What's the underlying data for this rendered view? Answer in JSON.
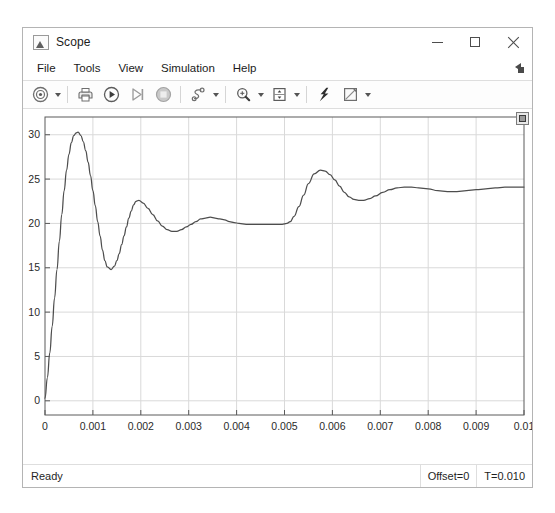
{
  "window": {
    "title": "Scope",
    "icon": "scope-app-icon",
    "controls": {
      "minimize": "minimize-icon",
      "maximize": "maximize-icon",
      "close": "close-icon"
    }
  },
  "menu": {
    "items": [
      {
        "label": "File"
      },
      {
        "label": "Tools"
      },
      {
        "label": "View"
      },
      {
        "label": "Simulation"
      },
      {
        "label": "Help"
      }
    ],
    "overflow_icon": "menu-overflow-arrow-icon"
  },
  "toolbar": {
    "buttons": [
      {
        "name": "configuration-properties-button",
        "icon": "gear-target-icon",
        "caret": true
      },
      {
        "name": "print-button",
        "icon": "printer-icon",
        "caret": false
      },
      {
        "name": "run-button",
        "icon": "play-circle-icon",
        "caret": false
      },
      {
        "name": "step-forward-button",
        "icon": "step-forward-icon",
        "caret": false
      },
      {
        "name": "stop-button",
        "icon": "stop-circle-icon",
        "caret": false
      },
      {
        "name": "simulation-stepping-button",
        "icon": "stepping-options-icon",
        "caret": true
      },
      {
        "name": "zoom-in-button",
        "icon": "magnifier-plus-icon",
        "caret": true
      },
      {
        "name": "autoscale-button",
        "icon": "autoscale-icon",
        "caret": true
      },
      {
        "name": "cursor-measurements-button",
        "icon": "lightning-cursor-icon",
        "caret": false
      },
      {
        "name": "style-button",
        "icon": "pencil-style-icon",
        "caret": true
      }
    ],
    "float_icon": "floating-scope-icon"
  },
  "status": {
    "message": "Ready",
    "offset": "Offset=0",
    "time": "T=0.010"
  },
  "colors": {
    "trace": "#4d4d4d",
    "grid": "#d9d9d9",
    "axis": "#5a5a5a",
    "background": "#ffffff"
  },
  "chart_data": {
    "type": "line",
    "title": "",
    "xlabel": "",
    "ylabel": "",
    "xlim": [
      0,
      0.01
    ],
    "ylim": [
      -1.6,
      32.0
    ],
    "grid": true,
    "legend": "none",
    "xticks": [
      0,
      0.001,
      0.002,
      0.003,
      0.004,
      0.005,
      0.006,
      0.007,
      0.008,
      0.009,
      0.01
    ],
    "xticklabels": [
      "0",
      "0.001",
      "0.002",
      "0.003",
      "0.004",
      "0.005",
      "0.006",
      "0.007",
      "0.008",
      "0.009",
      "0.01"
    ],
    "yticks": [
      0,
      5,
      10,
      15,
      20,
      25,
      30
    ],
    "yticklabels": [
      "0",
      "5",
      "10",
      "15",
      "20",
      "25",
      "30"
    ],
    "series": [
      {
        "name": "signal",
        "color": "#4d4d4d",
        "x": [
          0.0,
          5e-05,
          0.0001,
          0.00015,
          0.0002,
          0.00025,
          0.0003,
          0.00035,
          0.0004,
          0.00045,
          0.0005,
          0.00055,
          0.0006,
          0.00065,
          0.00069,
          0.00075,
          0.0008,
          0.00085,
          0.0009,
          0.00095,
          0.001,
          0.00105,
          0.0011,
          0.00115,
          0.0012,
          0.00125,
          0.0013,
          0.00138,
          0.00145,
          0.0015,
          0.00155,
          0.0016,
          0.00165,
          0.0017,
          0.00175,
          0.0018,
          0.00185,
          0.0019,
          0.00196,
          0.00205,
          0.00215,
          0.00225,
          0.00235,
          0.00245,
          0.00255,
          0.00265,
          0.00275,
          0.00285,
          0.00295,
          0.00305,
          0.00315,
          0.00325,
          0.00335,
          0.00345,
          0.00355,
          0.00365,
          0.00375,
          0.00385,
          0.00395,
          0.00405,
          0.0042,
          0.0044,
          0.0046,
          0.0048,
          0.00495,
          0.00505,
          0.00512,
          0.0052,
          0.0053,
          0.0054,
          0.0055,
          0.00562,
          0.00575,
          0.00585,
          0.00595,
          0.00605,
          0.00615,
          0.00625,
          0.00635,
          0.00645,
          0.00655,
          0.00665,
          0.00678,
          0.0069,
          0.00705,
          0.0072,
          0.00735,
          0.0075,
          0.00765,
          0.0078,
          0.008,
          0.0082,
          0.0084,
          0.0086,
          0.0088,
          0.009,
          0.0092,
          0.0094,
          0.0096,
          0.0098,
          0.01
        ],
        "y": [
          0.3,
          2.6,
          5.4,
          8.4,
          11.6,
          14.8,
          18.0,
          21.0,
          23.7,
          26.0,
          27.8,
          29.1,
          29.9,
          30.2,
          30.3,
          29.9,
          29.2,
          28.2,
          26.9,
          25.4,
          23.7,
          22.0,
          20.2,
          18.6,
          17.0,
          15.8,
          15.1,
          14.8,
          15.2,
          15.8,
          16.6,
          17.6,
          18.6,
          19.6,
          20.6,
          21.4,
          22.1,
          22.5,
          22.6,
          22.3,
          21.7,
          21.0,
          20.3,
          19.7,
          19.3,
          19.1,
          19.1,
          19.3,
          19.6,
          19.9,
          20.2,
          20.5,
          20.6,
          20.7,
          20.6,
          20.5,
          20.4,
          20.2,
          20.1,
          20.0,
          19.9,
          19.9,
          19.9,
          19.9,
          19.9,
          20.0,
          20.2,
          20.8,
          21.9,
          23.2,
          24.5,
          25.6,
          26.0,
          25.9,
          25.5,
          24.9,
          24.2,
          23.5,
          23.0,
          22.7,
          22.6,
          22.6,
          22.8,
          23.1,
          23.5,
          23.8,
          24.0,
          24.1,
          24.1,
          24.0,
          23.9,
          23.7,
          23.6,
          23.6,
          23.7,
          23.8,
          23.9,
          24.0,
          24.1,
          24.1,
          24.1
        ]
      }
    ]
  }
}
